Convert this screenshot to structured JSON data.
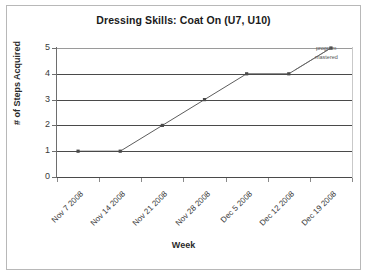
{
  "chart_data": {
    "type": "line",
    "title": "Dressing Skills: Coat On (U7, U10)",
    "xlabel": "Week",
    "ylabel": "# of Steps Acquired",
    "categories": [
      "Nov 7 2008",
      "Nov 14 2008",
      "Nov 21 2008",
      "Nov 28 2008",
      "Dec 5 2008",
      "Dec 12 2008",
      "Dec 19 2008"
    ],
    "values": [
      1,
      1,
      2,
      3,
      4,
      4,
      5
    ],
    "ylim": [
      0,
      5
    ],
    "yticks": [
      "0",
      "1",
      "2",
      "3",
      "4",
      "5"
    ],
    "grid": "horizontal",
    "legend": "none",
    "marker": "square",
    "series_color": "#4a4a4a",
    "gridline_color": "#4a4a4a",
    "annotations": [
      {
        "line1": "program",
        "line2": "mastered",
        "points_to_category": "Dec 19 2008",
        "points_to_value": 5
      }
    ]
  }
}
